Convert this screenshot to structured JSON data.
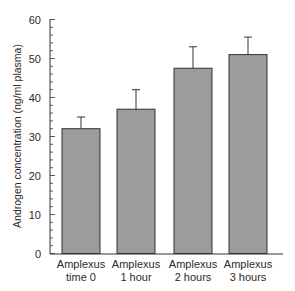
{
  "chart_data": {
    "type": "bar",
    "title": "",
    "xlabel": "",
    "ylabel": "Androgen concentration (ng/ml plasma)",
    "categories": [
      [
        "Amplexus",
        "time 0"
      ],
      [
        "Amplexus",
        "1 hour"
      ],
      [
        "Amplexus",
        "2 hours"
      ],
      [
        "Amplexus",
        "3 hours"
      ]
    ],
    "values": [
      32,
      37,
      47.5,
      51
    ],
    "error_upper": [
      35,
      42,
      53,
      55.5
    ],
    "ylim": [
      0,
      60
    ],
    "yticks": [
      0,
      10,
      20,
      30,
      40,
      50,
      60
    ],
    "minor_ticks_per_major": 5,
    "grid": false,
    "legend": null,
    "bar_color": "#9c9c9c",
    "edge_color": "#333333"
  }
}
